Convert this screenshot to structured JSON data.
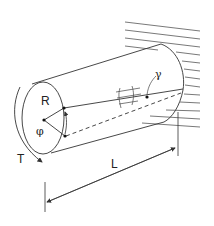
{
  "diagram": {
    "type": "torsion-of-cylindrical-shaft",
    "labels": {
      "radius": "R",
      "twist_angle": "φ",
      "torque": "T",
      "length": "L",
      "shear_strain": "γ"
    },
    "colors": {
      "stroke": "#333333",
      "background": "#ffffff"
    }
  }
}
